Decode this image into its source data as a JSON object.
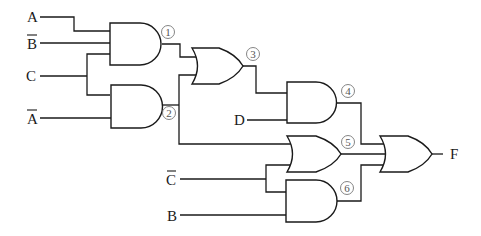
{
  "diagram": {
    "type": "logic-circuit",
    "inputs": [
      {
        "id": "A",
        "label": "A",
        "negated": false
      },
      {
        "id": "B_bar",
        "label": "B",
        "negated": true
      },
      {
        "id": "C",
        "label": "C",
        "negated": false
      },
      {
        "id": "A_bar",
        "label": "A",
        "negated": true
      },
      {
        "id": "D",
        "label": "D",
        "negated": false
      },
      {
        "id": "C_bar",
        "label": "C",
        "negated": true
      },
      {
        "id": "B",
        "label": "B",
        "negated": false
      }
    ],
    "gates": [
      {
        "id": "g1",
        "type": "AND",
        "number": "1",
        "inputs": [
          "A",
          "B̄",
          "C"
        ]
      },
      {
        "id": "g2",
        "type": "AND",
        "number": "2",
        "inputs": [
          "C",
          "Ā"
        ]
      },
      {
        "id": "g3",
        "type": "OR",
        "number": "3",
        "inputs": [
          "1",
          "2"
        ]
      },
      {
        "id": "g4",
        "type": "AND",
        "number": "4",
        "inputs": [
          "3",
          "D"
        ]
      },
      {
        "id": "g5",
        "type": "OR",
        "number": "5",
        "inputs": [
          "2",
          "C̄"
        ]
      },
      {
        "id": "g6",
        "type": "AND",
        "number": "6",
        "inputs": [
          "C̄",
          "B"
        ]
      },
      {
        "id": "g7",
        "type": "OR",
        "number": "",
        "inputs": [
          "4",
          "5",
          "6"
        ]
      }
    ],
    "output": {
      "label": "F"
    },
    "labels": {
      "in_A": "A",
      "in_B_bar": "B",
      "in_C": "C",
      "in_A_bar": "A",
      "in_D": "D",
      "in_C_bar": "C",
      "in_B": "B",
      "n1": "1",
      "n2": "2",
      "n3": "3",
      "n4": "4",
      "n5": "5",
      "n6": "6",
      "out_F": "F"
    }
  }
}
